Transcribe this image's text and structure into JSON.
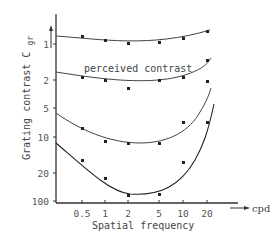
{
  "chart_data": {
    "type": "line",
    "title": "",
    "xlabel": "Spatial frequency",
    "x_unit": "cpd",
    "ylabel": "Grating contrast C gr",
    "x_scale": "log",
    "y_scale": "log (inverted)",
    "x_ticks": [
      "0.5",
      "1",
      "2",
      "5",
      "10",
      "20"
    ],
    "y_ticks": [
      "1",
      "2",
      "5",
      "10",
      "20",
      "100"
    ],
    "annotations": [
      "perceived contrast"
    ],
    "x": [
      0.5,
      1,
      2,
      5,
      10,
      20
    ],
    "series": [
      {
        "name": "curve 1 (top)",
        "values": [
          1.0,
          1.05,
          1.1,
          1.1,
          1.0,
          0.85
        ]
      },
      {
        "name": "perceived contrast",
        "values": [
          2.0,
          2.1,
          2.6,
          2.1,
          2.0,
          1.6
        ]
      },
      {
        "name": "curve 3",
        "values": [
          8,
          11,
          11.5,
          11.5,
          7,
          2.1
        ]
      },
      {
        "name": "curve 4 (bottom)",
        "values": [
          15,
          22,
          70,
          65,
          15,
          8
        ]
      }
    ],
    "grid": false,
    "legend": "none"
  },
  "axis": {
    "ylabel_main": "Grating contrast C",
    "ylabel_sub": "gr",
    "xlabel": "Spatial frequency",
    "x_unit": "cpd",
    "annotation": "perceived contrast"
  }
}
